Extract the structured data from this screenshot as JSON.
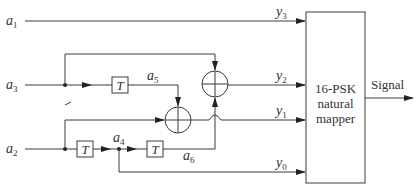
{
  "inputs": [
    {
      "name": "a",
      "sub": "1"
    },
    {
      "name": "a",
      "sub": "3"
    },
    {
      "name": "a",
      "sub": "2"
    }
  ],
  "internal_labels": [
    {
      "name": "a",
      "sub": "5"
    },
    {
      "name": "a",
      "sub": "4"
    },
    {
      "name": "a",
      "sub": "6"
    }
  ],
  "outputs": [
    {
      "name": "y",
      "sub": "3"
    },
    {
      "name": "y",
      "sub": "2"
    },
    {
      "name": "y",
      "sub": "1"
    },
    {
      "name": "y",
      "sub": "0"
    }
  ],
  "delay_label": "T",
  "mapper": {
    "lines": [
      "16-PSK",
      "natural",
      "mapper"
    ]
  },
  "output_label": "Signal"
}
